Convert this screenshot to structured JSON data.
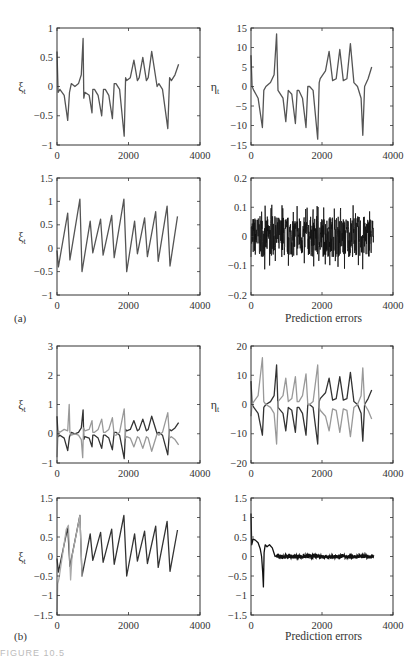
{
  "figure": {
    "caption_fragment": "FIGURE 10.5",
    "subfigure_labels": [
      "(a)",
      "(b)"
    ]
  },
  "chart_data": [
    {
      "id": "a1",
      "type": "line",
      "subfigure": "(a)",
      "position": "top-left",
      "ylabel": "ξt",
      "xlabel": "",
      "xlim": [
        0,
        4000
      ],
      "ylim": [
        -1,
        1
      ],
      "xticks": [
        0,
        2000,
        4000
      ],
      "yticks": [
        -1,
        -0.5,
        0,
        0.5,
        1
      ],
      "ytick_labels": [
        "−1",
        "−0.5",
        "0",
        "0.5",
        "1"
      ],
      "grid": false,
      "series": [
        {
          "name": "ξt",
          "color": "#555555",
          "x": [
            0,
            30,
            80,
            200,
            300,
            350,
            400,
            500,
            600,
            680,
            730,
            750,
            780,
            900,
            980,
            1000,
            1050,
            1150,
            1250,
            1300,
            1350,
            1450,
            1550,
            1600,
            1650,
            1750,
            1880,
            1920,
            1950,
            2050,
            2150,
            2250,
            2300,
            2400,
            2500,
            2550,
            2650,
            2800,
            2850,
            2950,
            3100,
            3150,
            3200,
            3300,
            3400
          ],
          "y": [
            0.6,
            -0.1,
            -0.05,
            -0.15,
            -0.58,
            -0.1,
            0.05,
            0.0,
            0.05,
            0.2,
            0.82,
            -0.2,
            -0.1,
            -0.15,
            -0.45,
            -0.05,
            -0.05,
            -0.15,
            -0.5,
            -0.05,
            -0.05,
            -0.15,
            -0.55,
            0.05,
            0.05,
            -0.05,
            -0.85,
            0.15,
            0.1,
            0.15,
            0.45,
            0.1,
            0.15,
            0.5,
            0.1,
            0.15,
            0.6,
            0.0,
            0.05,
            -0.05,
            -0.72,
            0.15,
            0.1,
            0.2,
            0.38
          ]
        }
      ]
    },
    {
      "id": "a2",
      "type": "line",
      "subfigure": "(a)",
      "position": "top-right",
      "ylabel": "ηt",
      "xlabel": "",
      "xlim": [
        0,
        4000
      ],
      "ylim": [
        -15,
        15
      ],
      "xticks": [
        0,
        2000,
        4000
      ],
      "yticks": [
        -15,
        -10,
        -5,
        0,
        5,
        10,
        15
      ],
      "ytick_labels": [
        "−15",
        "−10",
        "−5",
        "0",
        "5",
        "10",
        "15"
      ],
      "grid": false,
      "series": [
        {
          "name": "ηt",
          "color": "#555555",
          "x": [
            0,
            30,
            80,
            200,
            320,
            360,
            420,
            550,
            650,
            720,
            760,
            900,
            980,
            1050,
            1150,
            1250,
            1300,
            1350,
            1450,
            1550,
            1600,
            1650,
            1750,
            1880,
            1920,
            1950,
            2100,
            2200,
            2300,
            2400,
            2500,
            2600,
            2700,
            2800,
            2900,
            3000,
            3100,
            3150,
            3200,
            3300,
            3400
          ],
          "y": [
            8,
            0,
            -1,
            -3,
            -10.5,
            -1,
            0,
            1,
            3,
            13.5,
            -1,
            -3,
            -9,
            -1,
            -2,
            -9.5,
            -1,
            -1,
            -3,
            -10.5,
            0,
            0,
            -1,
            -13.5,
            1,
            2,
            4,
            9,
            1.5,
            2,
            9.5,
            1.5,
            2,
            11,
            1,
            0,
            -3,
            -12.5,
            0,
            2,
            5
          ]
        }
      ]
    },
    {
      "id": "a3",
      "type": "line",
      "subfigure": "(a)",
      "position": "second-left",
      "ylabel": "ξt",
      "xlabel": "",
      "xlim": [
        0,
        4000
      ],
      "ylim": [
        -1,
        1.5
      ],
      "xticks": [
        0,
        2000,
        4000
      ],
      "yticks": [
        -1,
        -0.5,
        0,
        0.5,
        1,
        1.5
      ],
      "ytick_labels": [
        "−1",
        "−0.5",
        "0",
        "0.5",
        "1",
        "1.5"
      ],
      "grid": false,
      "series": [
        {
          "name": "ξt",
          "color": "#555555",
          "x": [
            0,
            40,
            300,
            360,
            640,
            700,
            930,
            1000,
            1220,
            1290,
            1530,
            1600,
            1870,
            1950,
            2170,
            2250,
            2450,
            2530,
            2760,
            2830,
            3080,
            3160,
            3370
          ],
          "y": [
            -0.05,
            -0.4,
            0.75,
            -0.25,
            1.05,
            -0.5,
            0.58,
            -0.1,
            0.62,
            -0.15,
            0.7,
            -0.2,
            1.05,
            -0.5,
            0.58,
            -0.12,
            0.65,
            -0.18,
            0.78,
            -0.28,
            0.9,
            -0.38,
            0.68
          ]
        }
      ]
    },
    {
      "id": "a4",
      "type": "line",
      "subfigure": "(a)",
      "position": "second-right",
      "ylabel": "",
      "xlabel": "Prediction errors",
      "xlim": [
        0,
        4000
      ],
      "ylim": [
        -0.2,
        0.2
      ],
      "xticks": [
        0,
        2000,
        4000
      ],
      "yticks": [
        -0.2,
        -0.1,
        0,
        0.1,
        0.2
      ],
      "ytick_labels": [
        "−0.2",
        "−0.1",
        "0",
        "0.1",
        "0.2"
      ],
      "grid": false,
      "series": [
        {
          "name": "prediction error",
          "color": "#111111",
          "description": "dense noise band around 0, amplitude ~±0.07, spikes up to ±0.11, x from 0 to ~3450",
          "x_range": [
            0,
            3450
          ],
          "mean": 0,
          "band": [
            -0.07,
            0.07
          ],
          "extremes": [
            -0.115,
            0.11
          ]
        }
      ]
    },
    {
      "id": "b1",
      "type": "line",
      "subfigure": "(b)",
      "position": "third-left",
      "ylabel": "ξt",
      "xlabel": "",
      "xlim": [
        0,
        4000
      ],
      "ylim": [
        -1,
        3
      ],
      "xticks": [
        0,
        2000,
        4000
      ],
      "yticks": [
        -1,
        0,
        1,
        2,
        3
      ],
      "ytick_labels": [
        "−1",
        "0",
        "1",
        "2",
        "3"
      ],
      "grid": false,
      "series": [
        {
          "name": "ξt (true)",
          "color": "#333333",
          "x": [
            0,
            30,
            80,
            200,
            300,
            350,
            400,
            500,
            600,
            680,
            730,
            750,
            780,
            900,
            980,
            1000,
            1050,
            1150,
            1250,
            1300,
            1350,
            1450,
            1550,
            1600,
            1650,
            1750,
            1880,
            1920,
            1950,
            2050,
            2150,
            2250,
            2300,
            2400,
            2500,
            2550,
            2650,
            2800,
            2850,
            2950,
            3100,
            3150,
            3200,
            3300,
            3400
          ],
          "y": [
            0.6,
            -0.1,
            -0.05,
            -0.15,
            -0.58,
            -0.1,
            0.05,
            0.0,
            0.05,
            0.2,
            0.82,
            -0.2,
            -0.1,
            -0.15,
            -0.45,
            -0.05,
            -0.05,
            -0.15,
            -0.5,
            -0.05,
            -0.05,
            -0.15,
            -0.55,
            0.05,
            0.05,
            -0.05,
            -0.85,
            0.15,
            0.1,
            0.15,
            0.45,
            0.1,
            0.15,
            0.5,
            0.1,
            0.15,
            0.6,
            0.0,
            0.05,
            -0.05,
            -0.72,
            0.15,
            0.1,
            0.2,
            0.38
          ]
        },
        {
          "name": "ξt (estimate)",
          "color": "#999999",
          "x": [
            0,
            30,
            80,
            200,
            300,
            340,
            360,
            400,
            500,
            600,
            680,
            720,
            740,
            780,
            900,
            980,
            1000,
            1050,
            1150,
            1250,
            1300,
            1350,
            1450,
            1550,
            1600,
            1650,
            1750,
            1880,
            1920,
            1950,
            2050,
            2150,
            2250,
            2300,
            2400,
            2500,
            2550,
            2650,
            2800,
            2850,
            2950,
            3100,
            3150,
            3200,
            3300,
            3400
          ],
          "y": [
            -0.8,
            0.1,
            0.05,
            0.15,
            0.1,
            1.0,
            0.05,
            -0.05,
            0.0,
            -0.05,
            -0.2,
            -0.82,
            0.2,
            0.1,
            0.15,
            0.45,
            0.05,
            0.05,
            0.15,
            0.5,
            0.05,
            0.05,
            0.15,
            0.55,
            -0.05,
            -0.05,
            0.05,
            0.85,
            -0.15,
            -0.1,
            -0.15,
            -0.45,
            -0.1,
            -0.15,
            -0.5,
            -0.1,
            -0.15,
            -0.6,
            0.0,
            -0.05,
            0.05,
            0.72,
            -0.15,
            -0.1,
            -0.2,
            -0.38
          ]
        }
      ]
    },
    {
      "id": "b2",
      "type": "line",
      "subfigure": "(b)",
      "position": "third-right",
      "ylabel": "ηt",
      "xlabel": "",
      "xlim": [
        0,
        4000
      ],
      "ylim": [
        -20,
        20
      ],
      "xticks": [
        0,
        2000,
        4000
      ],
      "yticks": [
        -20,
        -10,
        0,
        10,
        20
      ],
      "ytick_labels": [
        "−20",
        "−10",
        "0",
        "10",
        "20"
      ],
      "grid": false,
      "series": [
        {
          "name": "ηt (true)",
          "color": "#333333",
          "x": [
            0,
            30,
            80,
            200,
            320,
            360,
            420,
            550,
            650,
            720,
            760,
            900,
            980,
            1050,
            1150,
            1250,
            1300,
            1350,
            1450,
            1550,
            1600,
            1650,
            1750,
            1880,
            1920,
            1950,
            2100,
            2200,
            2300,
            2400,
            2500,
            2600,
            2700,
            2800,
            2900,
            3000,
            3100,
            3150,
            3200,
            3300,
            3400
          ],
          "y": [
            8,
            0,
            -1,
            -3,
            -10.5,
            -1,
            0,
            1,
            3,
            13.5,
            -1,
            -3,
            -9,
            -1,
            -2,
            -9.5,
            -1,
            -1,
            -3,
            -10.5,
            0,
            0,
            -1,
            -13.5,
            1,
            2,
            4,
            9,
            1.5,
            2,
            9.5,
            1.5,
            2,
            11,
            1,
            0,
            -3,
            -12.5,
            0,
            2,
            5
          ]
        },
        {
          "name": "ηt (estimate)",
          "color": "#999999",
          "x": [
            0,
            30,
            80,
            200,
            320,
            360,
            420,
            550,
            650,
            720,
            760,
            900,
            980,
            1050,
            1150,
            1250,
            1300,
            1350,
            1450,
            1550,
            1600,
            1650,
            1750,
            1880,
            1920,
            1950,
            2100,
            2200,
            2300,
            2400,
            2500,
            2600,
            2700,
            2800,
            2900,
            3000,
            3100,
            3150,
            3200,
            3300,
            3400
          ],
          "y": [
            -4,
            0,
            1,
            3,
            16,
            1,
            0,
            -1,
            -3,
            -13.5,
            1,
            3,
            9,
            1,
            2,
            9.5,
            1,
            1,
            3,
            10.5,
            0,
            0,
            1,
            13.5,
            -1,
            -2,
            -4,
            -9,
            -1.5,
            -2,
            -9.5,
            -1.5,
            -2,
            -11,
            -1,
            0,
            3,
            12.5,
            0,
            -2,
            -5
          ]
        }
      ]
    },
    {
      "id": "b3",
      "type": "line",
      "subfigure": "(b)",
      "position": "bottom-left",
      "ylabel": "ξt",
      "xlabel": "",
      "xlim": [
        0,
        4000
      ],
      "ylim": [
        -1.5,
        1.5
      ],
      "xticks": [
        0,
        2000,
        4000
      ],
      "yticks": [
        -1.5,
        -1,
        -0.5,
        0,
        0.5,
        1,
        1.5
      ],
      "ytick_labels": [
        "−1.5",
        "−1",
        "−0.5",
        "0",
        "0.5",
        "1",
        "1.5"
      ],
      "grid": false,
      "series": [
        {
          "name": "ξt (true)",
          "color": "#333333",
          "x": [
            0,
            40,
            300,
            360,
            640,
            700,
            930,
            1000,
            1220,
            1290,
            1530,
            1600,
            1870,
            1950,
            2170,
            2250,
            2450,
            2530,
            2760,
            2830,
            3080,
            3160,
            3370
          ],
          "y": [
            -0.05,
            -0.4,
            0.75,
            -0.25,
            1.05,
            -0.5,
            0.58,
            -0.1,
            0.62,
            -0.15,
            0.7,
            -0.2,
            1.05,
            -0.5,
            0.58,
            -0.12,
            0.65,
            -0.18,
            0.78,
            -0.28,
            0.9,
            -0.38,
            0.68
          ]
        },
        {
          "name": "ξt (estimate)",
          "color": "#aaaaaa",
          "x": [
            0,
            20,
            60,
            260,
            320,
            380,
            420,
            640,
            700
          ],
          "y": [
            -1.5,
            -0.7,
            -0.55,
            0.7,
            0.8,
            -0.6,
            0.0,
            1.05,
            -0.5
          ]
        }
      ]
    },
    {
      "id": "b4",
      "type": "line",
      "subfigure": "(b)",
      "position": "bottom-right",
      "ylabel": "",
      "xlabel": "Prediction errors",
      "xlim": [
        0,
        4000
      ],
      "ylim": [
        -1.5,
        1.5
      ],
      "xticks": [
        0,
        2000,
        4000
      ],
      "yticks": [
        -1.5,
        -1,
        -0.5,
        0,
        0.5,
        1,
        1.5
      ],
      "ytick_labels": [
        "−1.5",
        "−1",
        "−0.5",
        "0",
        "0.5",
        "1",
        "1.5"
      ],
      "grid": false,
      "series": [
        {
          "name": "prediction error",
          "color": "#111111",
          "x": [
            0,
            20,
            60,
            120,
            200,
            260,
            300,
            330,
            350,
            370,
            400,
            450,
            520,
            600,
            680,
            720,
            1000,
            2000,
            3000,
            3450
          ],
          "y": [
            1.1,
            0.3,
            0.45,
            0.42,
            0.35,
            0.2,
            0.0,
            -0.4,
            -0.78,
            0.1,
            0.3,
            0.25,
            0.3,
            0.22,
            0.0,
            0.02,
            0.0,
            0.0,
            0.0,
            0.0
          ]
        }
      ]
    }
  ]
}
